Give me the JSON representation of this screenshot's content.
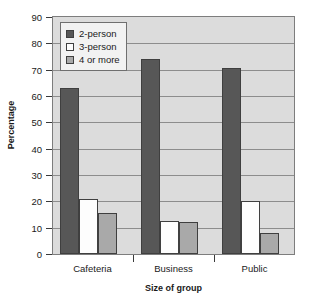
{
  "chart_data": {
    "type": "bar",
    "title": "",
    "xlabel": "Size of group",
    "ylabel": "Percentage",
    "categories": [
      "Cafeteria",
      "Business",
      "Public"
    ],
    "series": [
      {
        "name": "2-person",
        "values": [
          63,
          74,
          70.5
        ],
        "color": "#575757"
      },
      {
        "name": "3-person",
        "values": [
          21,
          12.5,
          20
        ],
        "color": "#fdfdfd"
      },
      {
        "name": "4 or more",
        "values": [
          15.5,
          12,
          8
        ],
        "color": "#a9a9a9"
      }
    ],
    "ylim": [
      0,
      90
    ],
    "ytick_step": 10,
    "yticks": [
      "0",
      "10",
      "20",
      "30",
      "40",
      "50",
      "60",
      "70",
      "80",
      "90"
    ],
    "grid": true,
    "legend_position": "top-left",
    "plot_background": "#dcdcdc",
    "axis_color": "#3a3a3a",
    "grid_color": "#8d8d8d"
  }
}
